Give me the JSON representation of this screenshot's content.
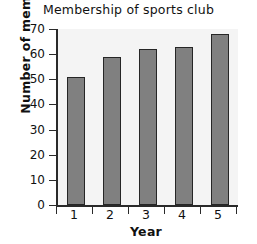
{
  "chart_data": {
    "type": "bar",
    "title": "Membership of sports club",
    "xlabel": "Year",
    "ylabel": "Number of members",
    "categories": [
      "1",
      "2",
      "3",
      "4",
      "5"
    ],
    "values": [
      51,
      59,
      62,
      63,
      68
    ],
    "ylim": [
      0,
      70
    ],
    "ytick_labels": [
      "0",
      "10",
      "20",
      "30",
      "40",
      "50",
      "60",
      "70"
    ],
    "ytick_values": [
      0,
      10,
      20,
      30,
      40,
      50,
      60,
      70
    ],
    "grid": false,
    "legend": null,
    "bar_color": "#808080",
    "bar_edge_color": "#262626",
    "axis_color": "#2a2a2a",
    "plot_background": "#f4f4f4",
    "figure_background": "#ffffff"
  }
}
